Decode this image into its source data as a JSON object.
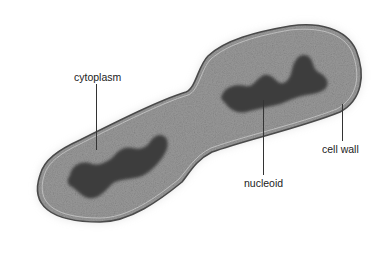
{
  "figure": {
    "colors": {
      "background": "#ffffff",
      "cytoplasm": "#8a8a8a",
      "nucleoid": "#3a3a3a",
      "cell_wall": "#5a5a5a",
      "label_text": "#222222"
    }
  },
  "labels": {
    "cytoplasm": "cytoplasm",
    "nucleoid": "nucleoid",
    "cell_wall": "cell wall"
  }
}
